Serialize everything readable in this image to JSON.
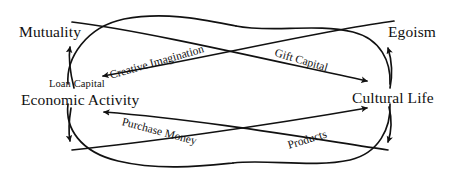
{
  "diagram": {
    "type": "lemniscate-flow-diagram",
    "width": 461,
    "height": 187,
    "background_color": "#ffffff",
    "stroke_color": "#111111",
    "text_color": "#111111",
    "nodes": [
      {
        "id": "mutuality",
        "label": "Mutuality",
        "position": "top-left",
        "size": "major"
      },
      {
        "id": "egoism",
        "label": "Egoism",
        "position": "top-right",
        "size": "major"
      },
      {
        "id": "loan-capital",
        "label": "Loan Capital",
        "position": "middle-left",
        "size": "minor"
      },
      {
        "id": "economic-activity",
        "label": "Economic Activity",
        "position": "middle-left",
        "size": "major"
      },
      {
        "id": "cultural-life",
        "label": "Cultural Life",
        "position": "middle-right",
        "size": "major"
      }
    ],
    "arc_labels": [
      {
        "id": "creative-imagination",
        "label": "Creative Imagination",
        "rotation_deg": -16,
        "direction": "right-to-left"
      },
      {
        "id": "gift-capital",
        "label": "Gift Capital",
        "rotation_deg": 16.5,
        "direction": "left-to-right"
      },
      {
        "id": "purchase-money",
        "label": "Purchase Money",
        "rotation_deg": 15,
        "direction": "right-to-left"
      },
      {
        "id": "products",
        "label": "Products",
        "rotation_deg": -17,
        "direction": "left-to-right"
      }
    ],
    "flows": [
      {
        "id": "flow-creative-imagination",
        "from": "cultural-life",
        "to": "economic-activity",
        "label": "Creative Imagination"
      },
      {
        "id": "flow-gift-capital",
        "from": "economic-activity",
        "to": "cultural-life",
        "label": "Gift Capital"
      },
      {
        "id": "flow-purchase-money",
        "from": "cultural-life",
        "to": "economic-activity",
        "label": "Purchase Money"
      },
      {
        "id": "flow-products",
        "from": "economic-activity",
        "to": "cultural-life",
        "label": "Products"
      }
    ]
  }
}
